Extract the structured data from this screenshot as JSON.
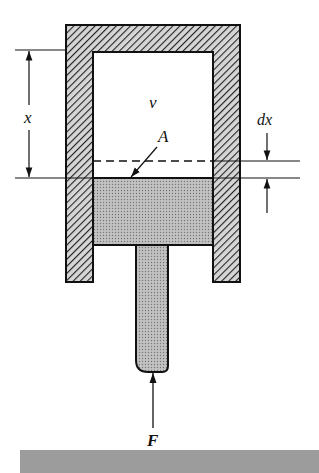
{
  "figure": {
    "labels": {
      "displacement": "x",
      "volume": "v",
      "area": "A",
      "increment": "dx",
      "force": "F"
    },
    "components": [
      "cylinder",
      "piston",
      "piston-rod",
      "dimension-x",
      "dimension-dx",
      "force-arrow"
    ],
    "colors": {
      "wall_fill": "#9a9a9a",
      "piston_fill": "#b4b4b4",
      "outline": "#111111",
      "bottom_bar": "#9c9c9c"
    }
  }
}
